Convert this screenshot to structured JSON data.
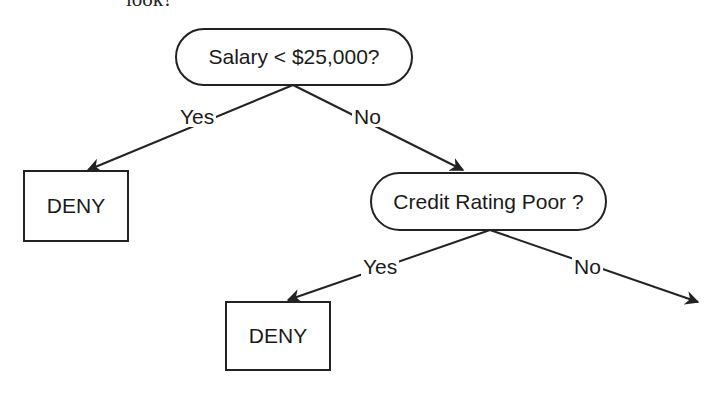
{
  "caption": "look?",
  "tree": {
    "root": {
      "label": "Salary < $25,000?",
      "yes_label": "Yes",
      "no_label": "No",
      "yes_outcome": {
        "label": "DENY"
      },
      "no_child": {
        "label": "Credit Rating Poor ?",
        "yes_label": "Yes",
        "no_label": "No",
        "yes_outcome": {
          "label": "DENY"
        },
        "no_outcome": null
      }
    }
  },
  "colors": {
    "stroke": "#222222",
    "text": "#1a1a1a",
    "background": "#ffffff"
  }
}
